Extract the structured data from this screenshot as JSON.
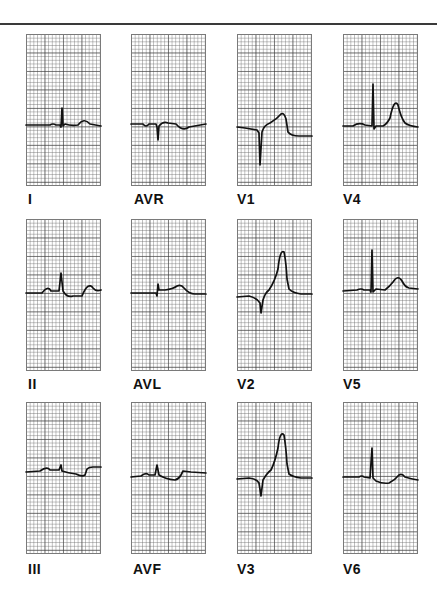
{
  "figure": {
    "title": "",
    "leads": [
      {
        "label": "I",
        "row": 0,
        "col": 0
      },
      {
        "label": "AVR",
        "row": 0,
        "col": 1
      },
      {
        "label": "V1",
        "row": 0,
        "col": 2
      },
      {
        "label": "V4",
        "row": 0,
        "col": 3
      },
      {
        "label": "II",
        "row": 1,
        "col": 0
      },
      {
        "label": "AVL",
        "row": 1,
        "col": 1
      },
      {
        "label": "V2",
        "row": 1,
        "col": 2
      },
      {
        "label": "V5",
        "row": 1,
        "col": 3
      },
      {
        "label": "III",
        "row": 2,
        "col": 0
      },
      {
        "label": "AVF",
        "row": 2,
        "col": 1
      },
      {
        "label": "V3",
        "row": 2,
        "col": 2
      },
      {
        "label": "V6",
        "row": 2,
        "col": 3
      }
    ],
    "colors": {
      "trace": "#111111",
      "grid_major": "#5a5a5a",
      "grid_minor": "#8a8a8a",
      "rule": "#3a3a3a"
    },
    "grid": {
      "small_divisions_across": 20,
      "large_divisions_across": 4,
      "large_divisions_down": 8
    }
  }
}
